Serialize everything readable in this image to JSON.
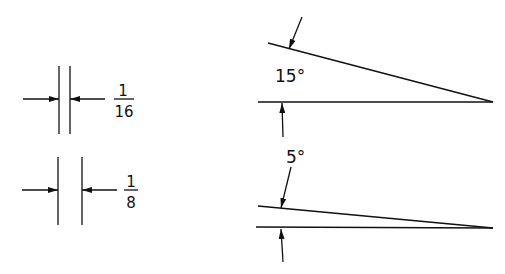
{
  "diagram": {
    "type": "technical-drawing-dimensioning",
    "colors": {
      "line": "#111111",
      "background": "#ffffff"
    },
    "linear_dimensions": [
      {
        "id": "gap-1-16",
        "numerator": "1",
        "denominator": "16",
        "label": "1/16"
      },
      {
        "id": "gap-1-8",
        "numerator": "1",
        "denominator": "8",
        "label": "1/8"
      }
    ],
    "angular_dimensions": [
      {
        "id": "angle-15",
        "label": "15°",
        "degrees": 15
      },
      {
        "id": "angle-5",
        "label": "5°",
        "degrees": 5
      }
    ]
  }
}
